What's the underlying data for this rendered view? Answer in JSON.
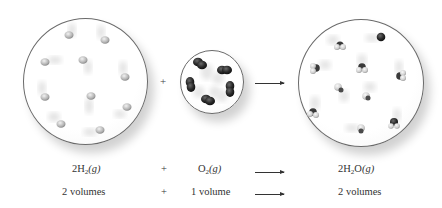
{
  "diagram": {
    "containers": [
      {
        "id": "h2",
        "molecule": "H2",
        "count": 10,
        "color": "#bdbdbd"
      },
      {
        "id": "o2",
        "molecule": "O2",
        "count": 5,
        "color": "#2a2a2a"
      },
      {
        "id": "h2o",
        "molecule": "H2O",
        "count": 10,
        "color_o": "#333333",
        "color_h": "#d6d6d6"
      }
    ],
    "operators": {
      "plus": "+",
      "arrow": "→"
    }
  },
  "equation": {
    "reactant1": {
      "coef": "2H",
      "sub": "2",
      "state": "(g)"
    },
    "plus": "+",
    "reactant2": {
      "coef": "O",
      "sub": "2",
      "state": "(g)"
    },
    "product": {
      "coef": "2H",
      "sub": "2",
      "rest": "O",
      "state": "(g)"
    }
  },
  "volumes": {
    "reactant1": "2 volumes",
    "plus": "+",
    "reactant2": "1 volume",
    "product": "2 volumes"
  }
}
